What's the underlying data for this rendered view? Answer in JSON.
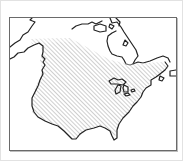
{
  "map": {
    "type": "range-map",
    "region": "North America",
    "legend": {
      "hatched_area": "Range"
    },
    "colors": {
      "coastline": "#222222",
      "hatch": "#b8b8b8",
      "land": "#ffffff",
      "frame": "#6a6a6a",
      "page_border": "#e2e2e2"
    },
    "features": [
      "coastline",
      "hudson-bay",
      "great-lakes",
      "florida",
      "gulf-coast",
      "pacific-coast",
      "arctic-islands",
      "newfoundland"
    ]
  }
}
